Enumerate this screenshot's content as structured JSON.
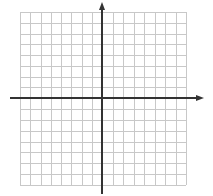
{
  "diagram": {
    "type": "coordinate-plane",
    "grid": {
      "columns": 16,
      "rows": 16,
      "left": 20,
      "right": 186,
      "top": 12,
      "bottom": 185,
      "line_color": "#c8c8c8",
      "background": "#ffffff"
    },
    "axes": {
      "color": "#333333",
      "origin": {
        "x": 102,
        "y": 98
      },
      "x_axis": {
        "start": 10,
        "end": 204,
        "arrow": "right"
      },
      "y_axis": {
        "start": 2,
        "end": 194,
        "arrow": "up"
      }
    }
  }
}
